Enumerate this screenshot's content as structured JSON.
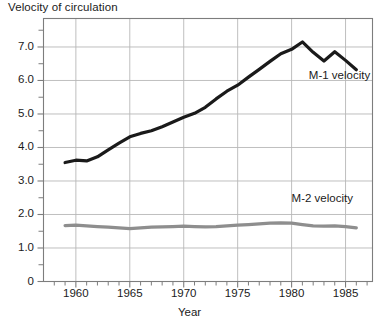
{
  "chart_data": {
    "type": "line",
    "title": "Velocity of circulation",
    "xlabel": "Year",
    "ylabel": "",
    "xlim": [
      1957.0,
      1987.5
    ],
    "ylim": [
      0,
      7.85
    ],
    "grid": true,
    "legend_position": "inline-right",
    "x_ticks": [
      1960,
      1965,
      1970,
      1975,
      1980,
      1985
    ],
    "x_tick_labels": [
      "1960",
      "1965",
      "1970",
      "1975",
      "1980",
      "1985"
    ],
    "x_minor_tick_interval": 1,
    "y_ticks": [
      0,
      1.0,
      2.0,
      3.0,
      4.0,
      5.0,
      6.0,
      7.0
    ],
    "y_tick_labels": [
      "0",
      "1.0",
      "2.0",
      "3.0",
      "4.0",
      "5.0",
      "6.0",
      "7.0"
    ],
    "y_minor_ticks": [
      0.5,
      1.5,
      2.5,
      3.5,
      4.5,
      5.5,
      6.5,
      7.5
    ],
    "series": [
      {
        "name": "M-1 velocity",
        "color": "#1a1a1a",
        "line_width": 3.2,
        "label_x": 1981.6,
        "label_y": 6.12,
        "x": [
          1959,
          1960,
          1961,
          1962,
          1963,
          1964,
          1965,
          1966,
          1967,
          1968,
          1969,
          1970,
          1971,
          1972,
          1973,
          1974,
          1975,
          1976,
          1977,
          1978,
          1979,
          1980,
          1981,
          1982,
          1983,
          1984,
          1985,
          1986
        ],
        "values": [
          3.55,
          3.62,
          3.6,
          3.72,
          3.93,
          4.13,
          4.32,
          4.42,
          4.5,
          4.62,
          4.76,
          4.9,
          5.02,
          5.2,
          5.45,
          5.68,
          5.86,
          6.1,
          6.33,
          6.57,
          6.8,
          6.93,
          7.15,
          6.84,
          6.58,
          6.86,
          6.6,
          6.32
        ]
      },
      {
        "name": "M-2 velocity",
        "color": "#8e8e8e",
        "line_width": 3.2,
        "label_x": 1980.0,
        "label_y": 2.45,
        "x": [
          1959,
          1960,
          1961,
          1962,
          1963,
          1964,
          1965,
          1966,
          1967,
          1968,
          1969,
          1970,
          1971,
          1972,
          1973,
          1974,
          1975,
          1976,
          1977,
          1978,
          1979,
          1980,
          1981,
          1982,
          1983,
          1984,
          1985,
          1986
        ],
        "values": [
          1.67,
          1.68,
          1.66,
          1.64,
          1.62,
          1.6,
          1.58,
          1.6,
          1.62,
          1.63,
          1.64,
          1.65,
          1.64,
          1.63,
          1.64,
          1.66,
          1.68,
          1.7,
          1.72,
          1.74,
          1.75,
          1.74,
          1.7,
          1.66,
          1.65,
          1.66,
          1.64,
          1.6
        ]
      }
    ]
  },
  "plot": {
    "frame_color": "#7d7d7d",
    "grid_color": "#b8b8b8",
    "background": "#ffffff"
  }
}
